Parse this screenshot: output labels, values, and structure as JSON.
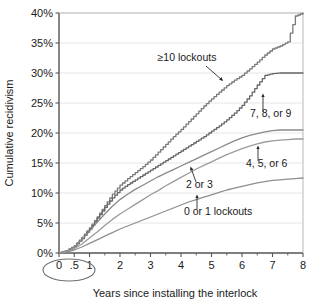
{
  "chart_data": {
    "type": "line",
    "title": "",
    "subtitle": "",
    "xlabel": "Years since installing the interlock",
    "ylabel": "Cumulative recidivism",
    "xlim": [
      0,
      8
    ],
    "ylim": [
      0,
      0.4
    ],
    "grid": "horizontal",
    "legend_position": "inline-annotations",
    "x_ticks": [
      "0",
      ".5",
      "1",
      "2",
      "3",
      "4",
      "5",
      "6",
      "7",
      "8"
    ],
    "x_tick_values": [
      0,
      0.5,
      1,
      2,
      3,
      4,
      5,
      6,
      7,
      8
    ],
    "x_minor_ticks": [
      1.5,
      2.5,
      3.5,
      4.5,
      5.5,
      6.5,
      7.5
    ],
    "y_ticks": [
      "0%",
      "5%",
      "10%",
      "15%",
      "20%",
      "25%",
      "30%",
      "35%",
      "40%"
    ],
    "y_tick_values": [
      0,
      0.05,
      0.1,
      0.15,
      0.2,
      0.25,
      0.3,
      0.35,
      0.4
    ],
    "highlight_annotation": {
      "shape": "ellipse",
      "encircles": [
        "0",
        ".5"
      ],
      "note": "circled x-axis tick labels 0 and .5"
    },
    "series": [
      {
        "name": "≥10 lockouts",
        "label": "≥10 lockouts",
        "color": "#7a7a7a",
        "final_value": 0.4,
        "x": [
          0,
          0.25,
          0.5,
          0.75,
          1.0,
          1.25,
          1.5,
          1.75,
          2.0,
          2.25,
          2.5,
          2.75,
          3.0,
          3.25,
          3.5,
          3.75,
          4.0,
          4.25,
          4.5,
          4.75,
          5.0,
          5.25,
          5.5,
          5.75,
          6.0,
          6.25,
          6.5,
          6.75,
          7.0,
          7.25,
          7.5,
          7.75,
          8.0
        ],
        "values": [
          0,
          0.004,
          0.012,
          0.026,
          0.042,
          0.06,
          0.079,
          0.098,
          0.113,
          0.124,
          0.134,
          0.144,
          0.155,
          0.168,
          0.181,
          0.194,
          0.206,
          0.219,
          0.232,
          0.245,
          0.257,
          0.268,
          0.279,
          0.288,
          0.296,
          0.307,
          0.318,
          0.33,
          0.34,
          0.345,
          0.352,
          0.395,
          0.4
        ]
      },
      {
        "name": "7, 8, or 9",
        "label": "7, 8, or 9",
        "color": "#666666",
        "final_value": 0.3,
        "x": [
          0,
          0.25,
          0.5,
          0.75,
          1.0,
          1.25,
          1.5,
          1.75,
          2.0,
          2.25,
          2.5,
          2.75,
          3.0,
          3.25,
          3.5,
          3.75,
          4.0,
          4.25,
          4.5,
          4.75,
          5.0,
          5.25,
          5.5,
          5.75,
          6.0,
          6.25,
          6.5,
          6.75,
          7.0,
          7.25,
          7.5,
          7.75,
          8.0
        ],
        "values": [
          0,
          0.004,
          0.011,
          0.024,
          0.04,
          0.058,
          0.076,
          0.092,
          0.105,
          0.114,
          0.122,
          0.13,
          0.138,
          0.146,
          0.154,
          0.162,
          0.17,
          0.178,
          0.186,
          0.194,
          0.203,
          0.212,
          0.222,
          0.233,
          0.246,
          0.262,
          0.28,
          0.296,
          0.299,
          0.3,
          0.3,
          0.3,
          0.3
        ]
      },
      {
        "name": "4, 5, or 6",
        "label": "4, 5, or 6",
        "color": "#8a8a8a",
        "final_value": 0.205,
        "x": [
          0,
          0.25,
          0.5,
          0.75,
          1.0,
          1.25,
          1.5,
          1.75,
          2.0,
          2.25,
          2.5,
          2.75,
          3.0,
          3.25,
          3.5,
          3.75,
          4.0,
          4.25,
          4.5,
          4.75,
          5.0,
          5.25,
          5.5,
          5.75,
          6.0,
          6.25,
          6.5,
          6.75,
          7.0,
          7.25,
          7.5,
          7.75,
          8.0
        ],
        "values": [
          0,
          0.003,
          0.01,
          0.022,
          0.036,
          0.051,
          0.065,
          0.078,
          0.089,
          0.098,
          0.106,
          0.113,
          0.12,
          0.127,
          0.133,
          0.139,
          0.145,
          0.151,
          0.157,
          0.163,
          0.169,
          0.175,
          0.181,
          0.187,
          0.192,
          0.196,
          0.199,
          0.202,
          0.204,
          0.205,
          0.205,
          0.205,
          0.205
        ]
      },
      {
        "name": "2 or 3",
        "label": "2 or 3",
        "color": "#9b9b9b",
        "final_value": 0.19,
        "x": [
          0,
          0.25,
          0.5,
          0.75,
          1.0,
          1.25,
          1.5,
          1.75,
          2.0,
          2.25,
          2.5,
          2.75,
          3.0,
          3.25,
          3.5,
          3.75,
          4.0,
          4.25,
          4.5,
          4.75,
          5.0,
          5.25,
          5.5,
          5.75,
          6.0,
          6.25,
          6.5,
          6.75,
          7.0,
          7.25,
          7.5,
          7.75,
          8.0
        ],
        "values": [
          0,
          0.002,
          0.007,
          0.015,
          0.025,
          0.035,
          0.046,
          0.056,
          0.065,
          0.073,
          0.081,
          0.089,
          0.097,
          0.104,
          0.112,
          0.119,
          0.126,
          0.133,
          0.14,
          0.146,
          0.152,
          0.158,
          0.164,
          0.169,
          0.174,
          0.178,
          0.182,
          0.185,
          0.187,
          0.188,
          0.189,
          0.19,
          0.19
        ]
      },
      {
        "name": "0 or 1 lockouts",
        "label": "0 or 1 lockouts",
        "color": "#8f8f8f",
        "final_value": 0.125,
        "x": [
          0,
          0.25,
          0.5,
          0.75,
          1.0,
          1.25,
          1.5,
          1.75,
          2.0,
          2.25,
          2.5,
          2.75,
          3.0,
          3.25,
          3.5,
          3.75,
          4.0,
          4.25,
          4.5,
          4.75,
          5.0,
          5.25,
          5.5,
          5.75,
          6.0,
          6.25,
          6.5,
          6.75,
          7.0,
          7.25,
          7.5,
          7.75,
          8.0
        ],
        "values": [
          0,
          0.002,
          0.005,
          0.01,
          0.016,
          0.022,
          0.028,
          0.034,
          0.04,
          0.045,
          0.05,
          0.055,
          0.06,
          0.065,
          0.07,
          0.075,
          0.08,
          0.085,
          0.089,
          0.093,
          0.097,
          0.101,
          0.105,
          0.108,
          0.111,
          0.114,
          0.117,
          0.119,
          0.121,
          0.122,
          0.123,
          0.124,
          0.125
        ]
      }
    ],
    "annotations": [
      {
        "text": "≥10 lockouts",
        "series": "≥10 lockouts",
        "arrow": "down-right"
      },
      {
        "text": "7, 8, or 9",
        "series": "7, 8, or 9",
        "arrow": "up"
      },
      {
        "text": "4, 5, or 6",
        "series": "4, 5, or 6",
        "arrow": "up"
      },
      {
        "text": "2 or 3",
        "series": "2 or 3",
        "arrow": "up-left"
      },
      {
        "text": "0 or 1 lockouts",
        "series": "0 or 1 lockouts",
        "arrow": "up"
      }
    ]
  },
  "colors": {
    "axis": "#555555",
    "grid": "#e3e3e3",
    "text": "#1a1a1a",
    "background": "#ffffff"
  }
}
